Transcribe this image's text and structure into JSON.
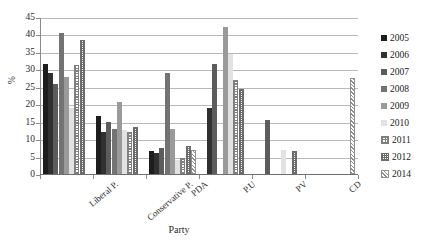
{
  "chart_data": {
    "type": "bar",
    "title": "",
    "xlabel": "Party",
    "ylabel": "%",
    "ylim": [
      0,
      45
    ],
    "ytick_step": 5,
    "yticks": [
      "45",
      "40",
      "35",
      "30",
      "25",
      "20",
      "15",
      "10",
      "5",
      "0"
    ],
    "grid": "horizontal",
    "legend_position": "right",
    "categories": [
      "Liberal P.",
      "Conservative P.",
      "PDA",
      "P.U",
      "PV",
      "CD"
    ],
    "series": [
      {
        "name": "2005",
        "color": "#1d1d1d",
        "pattern": "solid",
        "values": [
          31.5,
          16.5,
          6.5,
          null,
          null,
          null
        ]
      },
      {
        "name": "2006",
        "color": "#303030",
        "pattern": "solid",
        "values": [
          29.0,
          12.0,
          6.0,
          19.0,
          null,
          null
        ]
      },
      {
        "name": "2007",
        "color": "#5c5c5c",
        "pattern": "solid",
        "values": [
          25.7,
          15.0,
          7.5,
          31.5,
          15.5,
          null
        ]
      },
      {
        "name": "2008",
        "color": "#737373",
        "pattern": "solid",
        "values": [
          40.3,
          13.0,
          29.0,
          null,
          null,
          null
        ]
      },
      {
        "name": "2009",
        "color": "#9a9a9a",
        "pattern": "solid",
        "values": [
          27.8,
          20.5,
          13.0,
          42.0,
          null,
          null
        ]
      },
      {
        "name": "2010",
        "color": "#e2e2e2",
        "pattern": "solid",
        "values": [
          19.0,
          12.5,
          4.0,
          34.5,
          7.0,
          null
        ]
      },
      {
        "name": "2011",
        "color": "#808080",
        "pattern": "checker",
        "values": [
          31.3,
          12.0,
          4.5,
          27.0,
          null,
          null
        ]
      },
      {
        "name": "2012",
        "color": "#6b6b6b",
        "pattern": "checker-dense",
        "values": [
          38.5,
          13.5,
          8.0,
          24.5,
          6.5,
          null
        ]
      },
      {
        "name": "2014",
        "color": "#8f8f8f",
        "pattern": "diagonal",
        "values": [
          null,
          null,
          7.0,
          null,
          null,
          27.5
        ]
      }
    ]
  },
  "legend": {
    "items": [
      {
        "label": "2005"
      },
      {
        "label": "2006"
      },
      {
        "label": "2007"
      },
      {
        "label": "2008"
      },
      {
        "label": "2009"
      },
      {
        "label": "2010"
      },
      {
        "label": "2011"
      },
      {
        "label": "2012"
      },
      {
        "label": "2014"
      }
    ]
  }
}
